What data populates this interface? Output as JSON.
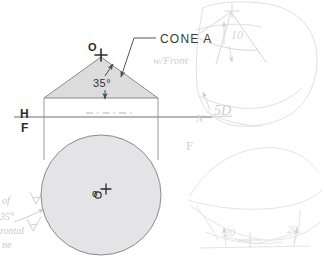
{
  "drawing": {
    "title_label": "CONE A",
    "note_label": "w/Front",
    "angle_label": "35°",
    "apex_point_label": "O",
    "center_point_label": "o",
    "ref_line_upper_label": "H",
    "ref_line_lower_label": "F",
    "front_view_marker": "N",
    "sketch_label_5d": "5D",
    "sketch_label_f": "F",
    "sketch_dim_left": "20",
    "sketch_dim_right": "20",
    "sketch_dim_top": "10",
    "margin_note_1": "of",
    "margin_note_2": "35°",
    "margin_note_3": "rontal",
    "margin_note_4": "ne",
    "margin_letter_1": "A",
    "margin_letter_2": "A",
    "colors": {
      "ink": "#2b2b2b",
      "outline": "#7b7b84",
      "fill_light": "#dcdcdc",
      "fill_circle": "#e2e2e4",
      "pencil_faint": "#d2d2d8",
      "background": "#ffffff"
    },
    "geometry": {
      "triangle_apex": [
        101,
        57
      ],
      "triangle_base_left": [
        44,
        98
      ],
      "triangle_base_right": [
        158,
        98
      ],
      "circle_center": [
        101,
        195
      ],
      "circle_radius": 60,
      "ref_line_y": 117,
      "projector_left_x": 44,
      "projector_right_x": 158
    }
  }
}
